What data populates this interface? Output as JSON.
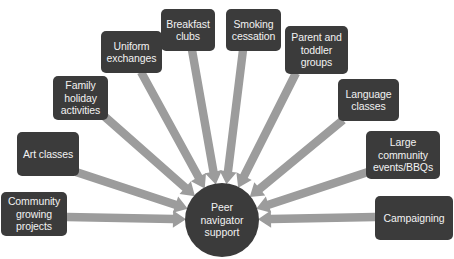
{
  "diagram": {
    "type": "radial-convergence",
    "background_color": "#ffffff",
    "node_color": "#3b3b3b",
    "node_text_color": "#f2f2f2",
    "arrow_color": "#9c9c9c",
    "hub": {
      "label": "Peer\nnavigator\nsupport",
      "shape": "circle",
      "cx": 222,
      "cy": 220,
      "r": 37
    },
    "nodes": [
      {
        "id": "community-growing-projects",
        "label": "Community\ngrowing\nprojects",
        "x": 1,
        "y": 192,
        "w": 66,
        "h": 44,
        "anchor_x": 67,
        "anchor_y": 217
      },
      {
        "id": "art-classes",
        "label": "Art classes",
        "x": 17,
        "y": 132,
        "w": 62,
        "h": 44,
        "anchor_x": 76,
        "anchor_y": 172
      },
      {
        "id": "family-holiday-activities",
        "label": "Family\nholiday\nactivities",
        "x": 53,
        "y": 76,
        "w": 55,
        "h": 44,
        "anchor_x": 104,
        "anchor_y": 116
      },
      {
        "id": "uniform-exchanges",
        "label": "Uniform\nexchanges",
        "x": 101,
        "y": 31,
        "w": 61,
        "h": 42,
        "anchor_x": 141,
        "anchor_y": 72
      },
      {
        "id": "breakfast-clubs",
        "label": "Breakfast\nclubs",
        "x": 161,
        "y": 9,
        "w": 54,
        "h": 42,
        "anchor_x": 192,
        "anchor_y": 50
      },
      {
        "id": "smoking-cessation",
        "label": "Smoking\ncessation",
        "x": 226,
        "y": 9,
        "w": 55,
        "h": 42,
        "anchor_x": 243,
        "anchor_y": 50
      },
      {
        "id": "parent-and-toddler-groups",
        "label": "Parent and\ntoddler\ngroups",
        "x": 285,
        "y": 26,
        "w": 63,
        "h": 48,
        "anchor_x": 296,
        "anchor_y": 73
      },
      {
        "id": "language-classes",
        "label": "Language\nclasses",
        "x": 338,
        "y": 79,
        "w": 61,
        "h": 42,
        "anchor_x": 343,
        "anchor_y": 120
      },
      {
        "id": "large-community-events-bbqs",
        "label": "Large\ncommunity\nevents/BBQs",
        "x": 366,
        "y": 131,
        "w": 74,
        "h": 48,
        "anchor_x": 368,
        "anchor_y": 172
      },
      {
        "id": "campaigning",
        "label": "Campaigning",
        "x": 375,
        "y": 196,
        "w": 78,
        "h": 44,
        "anchor_x": 375,
        "anchor_y": 217
      }
    ]
  }
}
